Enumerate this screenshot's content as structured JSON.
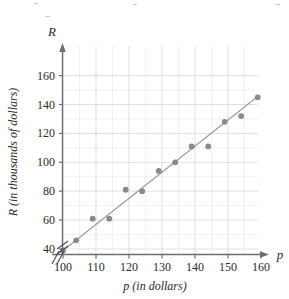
{
  "figure": {
    "axis_symbol_y": "R",
    "axis_symbol_x": "p",
    "xlabel": "p (in dollars)",
    "ylabel": "R (in thousands of dollars)"
  },
  "colors": {
    "point": "#8a8a8a",
    "line": "#9a9a9a",
    "grid": "#d8d8e4",
    "axis": "#6e6e6e",
    "text": "#2b2b2b"
  },
  "chart_data": {
    "type": "scatter",
    "title": "",
    "xlabel": "p (in dollars)",
    "ylabel": "R (in thousands of dollars)",
    "xlim": [
      95,
      165
    ],
    "ylim": [
      30,
      168
    ],
    "xticks": [
      100,
      110,
      120,
      130,
      140,
      150,
      160
    ],
    "yticks": [
      40,
      60,
      80,
      100,
      120,
      140,
      160
    ],
    "xtick_labels": [
      "100",
      "110",
      "120",
      "130",
      "140",
      "150",
      "160"
    ],
    "ytick_labels": [
      "40",
      "60",
      "80",
      "100",
      "120",
      "140",
      "160"
    ],
    "grid": true,
    "grid_minor_x_step": 5,
    "grid_minor_y_step": 10,
    "axis_break_x": true,
    "axis_break_y": true,
    "legend": null,
    "series": [
      {
        "name": "observations",
        "type": "scatter",
        "x": [
          100,
          104,
          109,
          114,
          119,
          124,
          129,
          134,
          139,
          144,
          149,
          154,
          159
        ],
        "y": [
          39,
          46,
          61,
          61,
          81,
          80,
          94,
          100,
          111,
          111,
          128,
          132,
          145
        ]
      },
      {
        "name": "trend-line",
        "type": "line",
        "x": [
          100,
          159
        ],
        "y": [
          39,
          145.5
        ]
      }
    ]
  }
}
